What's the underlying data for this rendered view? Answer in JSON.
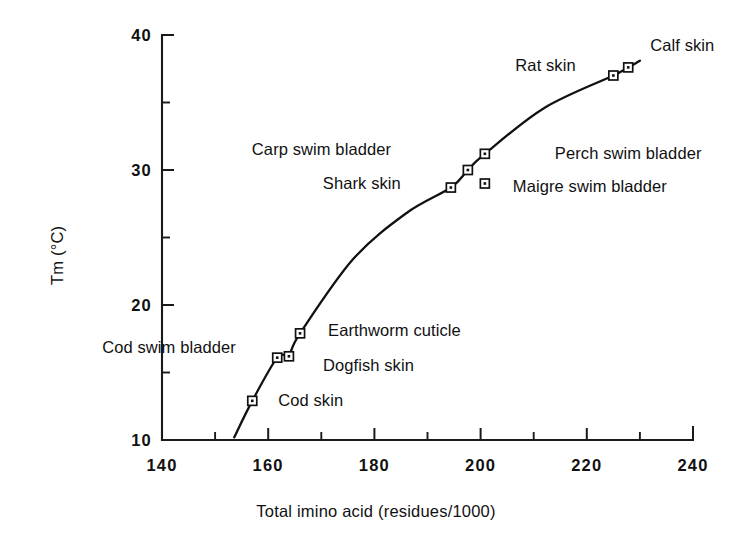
{
  "chart_data": {
    "type": "scatter",
    "title": "",
    "xlabel": "Total imino acid (residues/1000)",
    "ylabel": "Tm (°C)",
    "xlim": [
      140,
      240
    ],
    "ylim": [
      10,
      40
    ],
    "xticks": [
      "140",
      "160",
      "180",
      "200",
      "220",
      "240"
    ],
    "yticks": [
      "40",
      "30",
      "20",
      "10"
    ],
    "xtick_values": [
      140,
      160,
      180,
      200,
      220,
      240
    ],
    "ytick_values": [
      40,
      30,
      20,
      10
    ],
    "y_minor_ticks": [
      35,
      25,
      15
    ],
    "x_minor_ticks": [
      150,
      170,
      190,
      210,
      230
    ],
    "grid": false,
    "legend": "none",
    "marker_style": "open-square-with-dot",
    "line_color": "#111111",
    "points": [
      {
        "label": "Cod skin",
        "x": 157.0,
        "y": 12.9,
        "label_dx": 26,
        "label_dy": -1
      },
      {
        "label": "Cod swim bladder",
        "x": 161.7,
        "y": 16.1,
        "label_dx": -175,
        "label_dy": -11
      },
      {
        "label": "Dogfish skin",
        "x": 163.9,
        "y": 16.2,
        "label_dx": 34,
        "label_dy": 9
      },
      {
        "label": "Earthworm cuticle",
        "x": 166.0,
        "y": 17.9,
        "label_dx": 28,
        "label_dy": -3
      },
      {
        "label": "Shark skin",
        "x": 194.4,
        "y": 28.7,
        "label_dx": -128,
        "label_dy": -5
      },
      {
        "label": "Carp swim bladder",
        "x": 197.6,
        "y": 30.0,
        "label_dx": -216,
        "label_dy": -21
      },
      {
        "label": "Maigre swim bladder",
        "x": 200.8,
        "y": 29.0,
        "label_dx": 28,
        "label_dy": 2
      },
      {
        "label": "Perch swim bladder",
        "x": 200.8,
        "y": 31.2,
        "label_dx": 70,
        "label_dy": -1
      },
      {
        "label": "Rat skin",
        "x": 225.0,
        "y": 37.0,
        "label_dx": -98,
        "label_dy": -11
      },
      {
        "label": "Calf skin",
        "x": 227.8,
        "y": 37.6,
        "label_dx": 22,
        "label_dy": -22
      }
    ],
    "curve_points": [
      [
        153.6,
        10.2
      ],
      [
        157.0,
        12.9
      ],
      [
        161.7,
        16.1
      ],
      [
        163.9,
        16.3
      ],
      [
        166.0,
        17.9
      ],
      [
        176.0,
        23.4
      ],
      [
        186.0,
        26.8
      ],
      [
        194.4,
        28.7
      ],
      [
        197.6,
        30.0
      ],
      [
        200.8,
        31.2
      ],
      [
        212.0,
        34.6
      ],
      [
        225.0,
        37.0
      ],
      [
        227.8,
        37.6
      ],
      [
        230.0,
        38.1
      ]
    ]
  }
}
